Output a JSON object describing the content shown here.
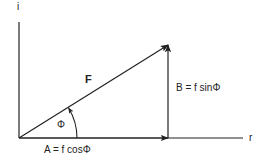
{
  "diagram": {
    "type": "vector-decomposition",
    "axes": {
      "vertical_label": "i",
      "horizontal_label": "r"
    },
    "vectors": {
      "resultant": {
        "label": "F"
      },
      "horizontal_component": {
        "label": "A = f cosΦ"
      },
      "vertical_component": {
        "label": "B = f sinΦ"
      }
    },
    "angle": {
      "label": "Φ"
    },
    "colors": {
      "stroke": "#222222",
      "background": "#ffffff"
    }
  }
}
